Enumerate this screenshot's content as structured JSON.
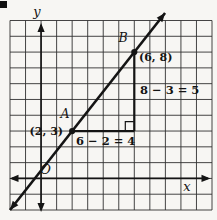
{
  "chart_data": {
    "type": "line",
    "grid": {
      "cols": 13,
      "rows": 12,
      "y_axis_col": 2,
      "x_axis_row": 10,
      "grid_on": true
    },
    "axes": {
      "x_label": "x",
      "y_label": "y",
      "origin_label": "O",
      "arrows_both_ends": true
    },
    "points": [
      {
        "name": "A",
        "x": 2,
        "y": 3,
        "coord_label": "(2, 3)"
      },
      {
        "name": "B",
        "x": 6,
        "y": 8,
        "coord_label": "(6, 8)"
      }
    ],
    "line_series": {
      "through_points": [
        "A",
        "B"
      ],
      "extended_with_arrows": true
    },
    "rise": {
      "label": "8 − 3 = 5",
      "value": 5
    },
    "run": {
      "label": "6 − 2 = 4",
      "value": 4
    },
    "right_angle_marker": {
      "x": 6,
      "y": 3
    },
    "colors": {
      "ink": "#141414",
      "grid_line": "#303030",
      "background": "#f7f6f3"
    }
  }
}
